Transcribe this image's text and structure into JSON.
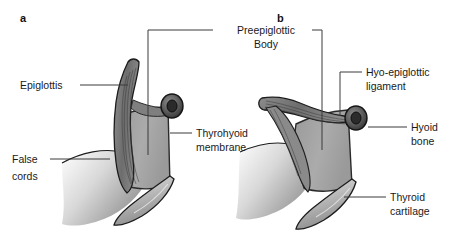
{
  "figure": {
    "background": "#ffffff",
    "width": 459,
    "height": 245
  },
  "colors": {
    "ink": "#1c1c1c",
    "leader": "#3b3b3b",
    "label_text": "#1a1a1a",
    "membrane_fill": "#a8a8a8",
    "cartilage_light": "#cfcfcf",
    "cartilage_mid": "#9d9d9d",
    "cartilage_dark": "#6f6f6f",
    "epiglottis_fill": "#7a7a7a",
    "hyoid_ring": "#5a5a5a",
    "false_cords": "#c2c2c2"
  },
  "panels": [
    {
      "id": "panel-a",
      "letter": "a",
      "letter_x": 20,
      "letter_y": 22
    },
    {
      "id": "panel-b",
      "letter": "b",
      "letter_x": 277,
      "letter_y": 22
    }
  ],
  "callouts": [
    {
      "id": "preepiglottic-body",
      "line1": "Preepiglottic",
      "line2": "Body",
      "text_x": 266,
      "text_y": 34,
      "anchor": "middle",
      "panel": "shared"
    },
    {
      "id": "epiglottis",
      "line1": "Epiglottis",
      "line2": "",
      "text_x": 20,
      "text_y": 89,
      "anchor": "start",
      "panel": "a"
    },
    {
      "id": "thyrohyoid-membrane",
      "line1": "Thyrohyoid",
      "line2": "membrane",
      "text_x": 196,
      "text_y": 137,
      "anchor": "start",
      "panel": "a"
    },
    {
      "id": "false-cords",
      "line1": "False",
      "line2": "cords",
      "text_x": 12,
      "text_y": 163,
      "anchor": "start",
      "panel": "a"
    },
    {
      "id": "hyo-epiglottic-ligament",
      "line1": "Hyo-epiglottic",
      "line2": "ligament",
      "text_x": 366,
      "text_y": 76,
      "anchor": "start",
      "panel": "b"
    },
    {
      "id": "hyoid-bone",
      "line1": "Hyoid",
      "line2": "bone",
      "text_x": 411,
      "text_y": 131,
      "anchor": "start",
      "panel": "b"
    },
    {
      "id": "thyroid-cartilage",
      "line1": "Thyroid",
      "line2": "cartilage",
      "text_x": 390,
      "text_y": 201,
      "anchor": "start",
      "panel": "b"
    }
  ]
}
